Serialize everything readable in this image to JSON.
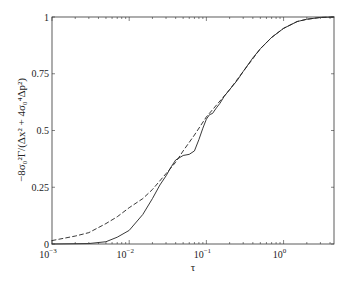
{
  "chart_data": {
    "type": "line",
    "title": "",
    "xlabel": "τ",
    "ylabel": "−8σ₀²Γ/(Δx² + 4σ₀⁴Δp²)",
    "xscale": "log",
    "xlim": [
      0.001,
      4.5
    ],
    "ylim": [
      0,
      1
    ],
    "grid": false,
    "legend": null,
    "x_ticks": [
      {
        "value": 0.001,
        "label": "10",
        "exp": "-3"
      },
      {
        "value": 0.01,
        "label": "10",
        "exp": "-2"
      },
      {
        "value": 0.1,
        "label": "10",
        "exp": "-1"
      },
      {
        "value": 1,
        "label": "10",
        "exp": "0"
      }
    ],
    "y_ticks": [
      {
        "value": 0,
        "label": "0"
      },
      {
        "value": 0.25,
        "label": "0.25"
      },
      {
        "value": 0.5,
        "label": "0.5"
      },
      {
        "value": 0.75,
        "label": "0.75"
      },
      {
        "value": 1,
        "label": "1"
      }
    ],
    "series": [
      {
        "name": "solid",
        "style": "solid",
        "color": "#222222",
        "x": [
          0.001,
          0.003,
          0.005,
          0.007,
          0.01,
          0.015,
          0.02,
          0.025,
          0.03,
          0.035,
          0.04,
          0.05,
          0.06,
          0.07,
          0.08,
          0.09,
          0.1,
          0.11,
          0.12,
          0.135,
          0.15,
          0.17,
          0.2,
          0.25,
          0.3,
          0.4,
          0.5,
          0.7,
          1,
          1.5,
          2,
          3,
          4.5
        ],
        "values": [
          0,
          0.002,
          0.01,
          0.03,
          0.06,
          0.13,
          0.2,
          0.26,
          0.3,
          0.34,
          0.37,
          0.39,
          0.395,
          0.41,
          0.46,
          0.51,
          0.55,
          0.57,
          0.575,
          0.6,
          0.62,
          0.65,
          0.68,
          0.72,
          0.76,
          0.82,
          0.86,
          0.91,
          0.95,
          0.98,
          0.99,
          0.998,
          1.0
        ]
      },
      {
        "name": "dashed",
        "style": "dashed",
        "color": "#222222",
        "x": [
          0.001,
          0.002,
          0.003,
          0.005,
          0.007,
          0.01,
          0.015,
          0.02,
          0.03,
          0.04,
          0.05,
          0.07,
          0.1,
          0.15,
          0.2,
          0.3,
          0.5,
          0.7,
          1,
          1.5,
          2,
          3,
          4.5
        ],
        "values": [
          0.015,
          0.035,
          0.05,
          0.09,
          0.12,
          0.16,
          0.2,
          0.24,
          0.31,
          0.36,
          0.41,
          0.48,
          0.56,
          0.63,
          0.68,
          0.76,
          0.86,
          0.91,
          0.95,
          0.98,
          0.99,
          0.998,
          1.0
        ]
      }
    ]
  }
}
